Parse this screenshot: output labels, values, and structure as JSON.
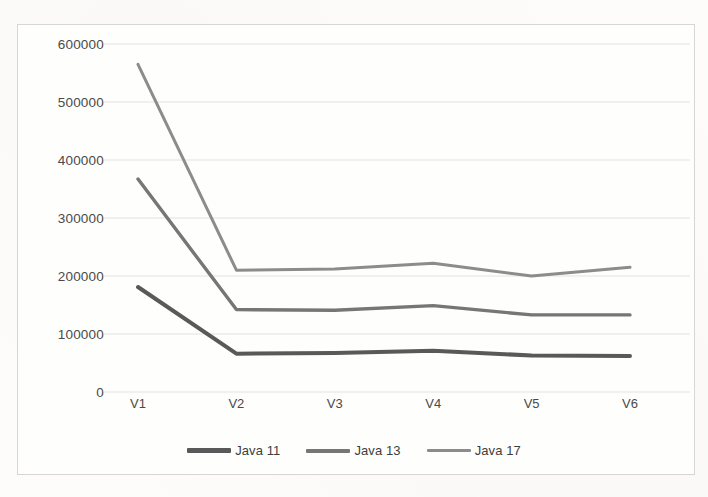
{
  "chart_data": {
    "type": "line",
    "title": "",
    "subtitle": "",
    "xlabel": "",
    "ylabel": "",
    "categories": [
      "V1",
      "V2",
      "V3",
      "V4",
      "V5",
      "V6"
    ],
    "yticks": [
      0,
      100000,
      200000,
      300000,
      400000,
      500000,
      600000
    ],
    "ytick_labels": [
      "0",
      "100000",
      "200000",
      "300000",
      "400000",
      "500000",
      "600000"
    ],
    "ylim": [
      0,
      600000
    ],
    "grid": true,
    "legend_position": "bottom",
    "series": [
      {
        "name": "Java 11",
        "color": "#595959",
        "values": [
          181000,
          66000,
          67000,
          71000,
          63000,
          62000
        ]
      },
      {
        "name": "Java 13",
        "color": "#767676",
        "values": [
          367000,
          142000,
          141000,
          149000,
          133000,
          133000
        ]
      },
      {
        "name": "Java 17",
        "color": "#8c8c8c",
        "values": [
          565000,
          210000,
          212000,
          222000,
          200000,
          215000
        ]
      }
    ]
  },
  "style": {
    "grid_color": "#e2e0dc",
    "border_color": "#d8d6d2",
    "text_color": "#4a4a4a",
    "background": "#fefefd"
  }
}
